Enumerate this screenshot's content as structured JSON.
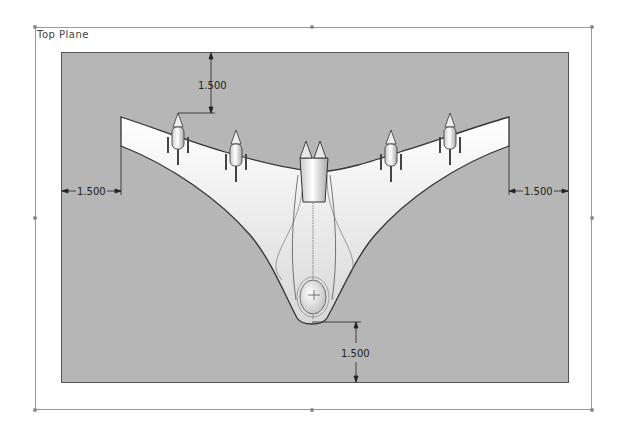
{
  "plane": {
    "label": "Top Plane"
  },
  "dimensions": {
    "top": "1.500",
    "left": "1.500",
    "right": "1.500",
    "bottom": "1.500"
  },
  "colors": {
    "viewport_bg": "#b6b6b6",
    "frame_line": "#9a9a9a",
    "part_fill": "#f2f2f2",
    "outline": "#333333"
  }
}
